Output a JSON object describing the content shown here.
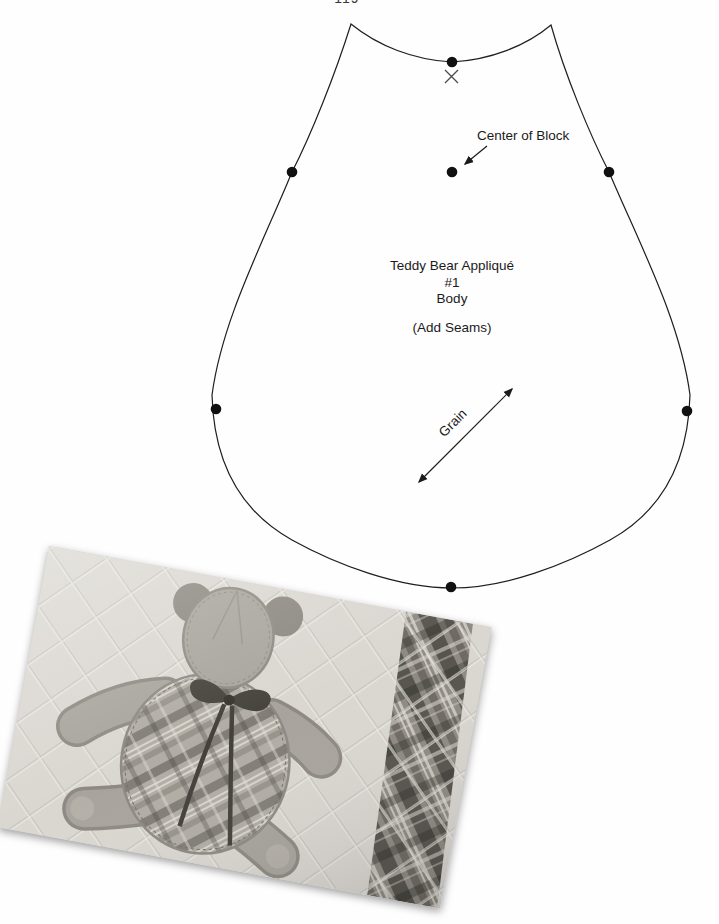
{
  "page": {
    "number": "119",
    "background_color": "#fefefe"
  },
  "pattern": {
    "center_label": "Center of Block",
    "title_line1": "Teddy Bear Appliqué",
    "title_line2": "#1",
    "title_line3": "Body",
    "seam_note": "(Add Seams)",
    "grain_label": "Grain",
    "line_color": "#1e1e1e",
    "dot_color": "#111111"
  },
  "photo": {
    "content": "black-and-white photograph of quilted teddy bear appliqué block",
    "fabric_color": "#dad7d1",
    "bear_color": "#a8a49d",
    "ear_color": "#8c8880",
    "ribbon_color": "#44413b",
    "plaid_dark": "#5a564f",
    "plaid_light": "#c9c5bd"
  }
}
